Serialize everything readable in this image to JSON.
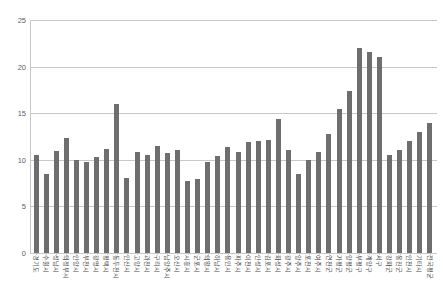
{
  "chart_data": {
    "type": "bar",
    "title": "",
    "subtitle": "",
    "xlabel": "",
    "ylabel": "",
    "ylim": [
      0,
      25
    ],
    "yticks": [
      0,
      5,
      10,
      15,
      20,
      25
    ],
    "ytick_labels": [
      "0",
      "5",
      "10",
      "15",
      "20",
      "25"
    ],
    "grid": true,
    "legend": null,
    "bar_color": "#6e6e6e",
    "grid_color": "#c8c8c8",
    "axis_text_color": "#4a4a4a",
    "categories": [
      "경기도",
      "수원시",
      "성남시",
      "의정부시",
      "안양시",
      "부천시",
      "광명시",
      "평택시",
      "동두천시",
      "안산시",
      "고양시",
      "과천시",
      "구리시",
      "남양주시",
      "오산시",
      "시흥시",
      "군포시",
      "의왕시",
      "하남시",
      "용인시",
      "파주시",
      "이천시",
      "안성시",
      "김포시",
      "화성시",
      "광주시",
      "양주시",
      "포천시",
      "여주시",
      "연천군",
      "가평군",
      "양평군",
      "부평구",
      "계양구",
      "서구",
      "강화군",
      "옹진군",
      "인천시",
      "기타시",
      "전국평균"
    ],
    "values": [
      10.5,
      8.5,
      10.9,
      12.3,
      10.0,
      9.8,
      10.3,
      11.2,
      16.0,
      8.0,
      10.8,
      10.5,
      11.5,
      10.7,
      11.0,
      7.7,
      7.9,
      9.8,
      10.4,
      11.4,
      10.8,
      11.9,
      12.0,
      12.1,
      14.4,
      11.0,
      8.5,
      10.0,
      10.8,
      12.8,
      15.5,
      17.4,
      22.0,
      21.6,
      21.0,
      10.5,
      11.0,
      12.0,
      13.0,
      14.0
    ]
  }
}
